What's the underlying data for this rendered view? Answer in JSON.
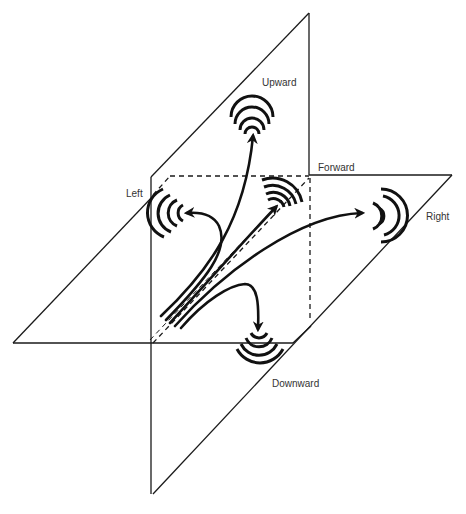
{
  "diagram": {
    "labels": {
      "upward": "Upward",
      "forward": "Forward",
      "left": "Left",
      "right": "Right",
      "downward": "Downward"
    },
    "colors": {
      "stroke": "#111111",
      "background": "#ffffff",
      "label": "#333333"
    },
    "directions": [
      {
        "name": "Upward",
        "icon": "sound-wave-icon"
      },
      {
        "name": "Forward",
        "icon": "sound-wave-icon"
      },
      {
        "name": "Left",
        "icon": "sound-wave-icon"
      },
      {
        "name": "Right",
        "icon": "sound-wave-icon"
      },
      {
        "name": "Downward",
        "icon": "sound-wave-icon"
      }
    ]
  }
}
